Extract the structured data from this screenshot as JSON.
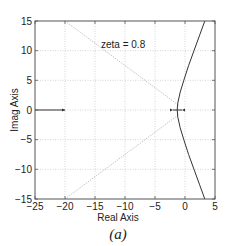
{
  "chart_data": {
    "type": "line",
    "title": "",
    "xlabel": "Real Axis",
    "ylabel": "Imag Axis",
    "xlim": [
      -25,
      5
    ],
    "ylim": [
      -15,
      15
    ],
    "xticks": [
      -25,
      -20,
      -15,
      -10,
      -5,
      0,
      5
    ],
    "yticks": [
      -15,
      -10,
      -5,
      0,
      5,
      10,
      15
    ],
    "xtick_labels": [
      "-25",
      "-20",
      "-15",
      "-10",
      "-5",
      "0",
      "5"
    ],
    "ytick_labels": [
      "-15",
      "-10",
      "-5",
      "0",
      "5",
      "10",
      "15"
    ],
    "grid": true,
    "caption": "(a)",
    "annotations": [
      {
        "text": "zeta = 0.8",
        "x": -14,
        "y": 11
      }
    ],
    "series": [
      {
        "name": "root-locus-branch",
        "style": "solid",
        "x": [
          3.3,
          2.4,
          1.5,
          0.6,
          -0.2,
          -0.8,
          -1.2,
          -1.3,
          -1.2,
          -0.8,
          -0.2,
          0.6,
          1.5,
          2.4,
          3.3
        ],
        "y": [
          15,
          12.5,
          10,
          7.5,
          5,
          3,
          1.2,
          0,
          -1.2,
          -3,
          -5,
          -7.5,
          -10,
          -12.5,
          -15
        ]
      },
      {
        "name": "real-axis-locus-left",
        "style": "solid",
        "x": [
          -25,
          -20
        ],
        "y": [
          0,
          0
        ]
      },
      {
        "name": "real-axis-locus-near-origin",
        "style": "solid",
        "x": [
          -2,
          -0.5
        ],
        "y": [
          0,
          0
        ]
      },
      {
        "name": "zeta-line-upper",
        "style": "dotted",
        "x": [
          -20,
          -1
        ],
        "y": [
          15,
          0.75
        ]
      },
      {
        "name": "zeta-line-lower",
        "style": "dotted",
        "x": [
          -20,
          -1
        ],
        "y": [
          -15,
          -0.75
        ]
      }
    ],
    "markers": [
      {
        "name": "arrow-left-segment",
        "x": -20,
        "y": 0
      },
      {
        "name": "arrow-near-origin-left",
        "x": -2,
        "y": 0
      },
      {
        "name": "arrow-near-origin-right",
        "x": -0.5,
        "y": 0
      }
    ]
  },
  "layout": {
    "plot_box": {
      "left": 35,
      "top": 21,
      "right": 215,
      "bottom": 199
    },
    "colors": {
      "axes": "#555555",
      "grid": "#bbbbbb",
      "locus": "#333333",
      "zeta": "#aaaaaa",
      "text": "#222222"
    }
  }
}
